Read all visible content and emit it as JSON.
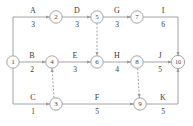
{
  "diagram": {
    "type": "activity-on-arrow-network",
    "title": "",
    "node_radius": 6.2,
    "accent_color": "#9a9a9a",
    "text_color": "#3b3b3b",
    "background": "#ffffff",
    "nodes": [
      {
        "id": "1",
        "label": "1",
        "x": 13,
        "y": 62
      },
      {
        "id": "2",
        "label": "2",
        "x": 56,
        "y": 17
      },
      {
        "id": "3",
        "label": "3",
        "x": 56,
        "y": 104
      },
      {
        "id": "4",
        "label": "4",
        "x": 52,
        "y": 62
      },
      {
        "id": "5",
        "label": "5",
        "x": 97,
        "y": 17
      },
      {
        "id": "6",
        "label": "6",
        "x": 97,
        "y": 62
      },
      {
        "id": "7",
        "label": "7",
        "x": 137,
        "y": 17
      },
      {
        "id": "8",
        "label": "8",
        "x": 137,
        "y": 62
      },
      {
        "id": "9",
        "label": "9",
        "x": 140,
        "y": 104
      },
      {
        "id": "10",
        "label": "10",
        "x": 178,
        "y": 62
      }
    ],
    "activities": [
      {
        "id": "A",
        "name": "A",
        "duration": "3",
        "from": "1",
        "to": "2",
        "label_x": 33,
        "label_y": 13,
        "dur_x": 33,
        "dur_y": 27
      },
      {
        "id": "B",
        "name": "B",
        "duration": "2",
        "from": "1",
        "to": "4",
        "label_x": 32,
        "label_y": 58,
        "dur_x": 32,
        "dur_y": 72
      },
      {
        "id": "C",
        "name": "C",
        "duration": "1",
        "from": "1",
        "to": "3",
        "label_x": 33,
        "label_y": 100,
        "dur_x": 33,
        "dur_y": 114
      },
      {
        "id": "D",
        "name": "D",
        "duration": "3",
        "from": "2",
        "to": "5",
        "label_x": 77,
        "label_y": 13,
        "dur_x": 77,
        "dur_y": 27
      },
      {
        "id": "E",
        "name": "E",
        "duration": "3",
        "from": "4",
        "to": "6",
        "label_x": 75,
        "label_y": 58,
        "dur_x": 75,
        "dur_y": 72
      },
      {
        "id": "F",
        "name": "F",
        "duration": "5",
        "from": "3",
        "to": "9",
        "label_x": 97,
        "label_y": 100,
        "dur_x": 97,
        "dur_y": 114
      },
      {
        "id": "G",
        "name": "G",
        "duration": "3",
        "from": "5",
        "to": "7",
        "label_x": 117,
        "label_y": 13,
        "dur_x": 117,
        "dur_y": 27
      },
      {
        "id": "H",
        "name": "H",
        "duration": "4",
        "from": "6",
        "to": "8",
        "label_x": 117,
        "label_y": 58,
        "dur_x": 117,
        "dur_y": 72
      },
      {
        "id": "I",
        "name": "I",
        "duration": "6",
        "from": "7",
        "to": "10",
        "label_x": 163,
        "label_y": 13,
        "dur_x": 163,
        "dur_y": 27
      },
      {
        "id": "J",
        "name": "J",
        "duration": "5",
        "from": "8",
        "to": "10",
        "label_x": 160,
        "label_y": 58,
        "dur_x": 160,
        "dur_y": 72
      },
      {
        "id": "K",
        "name": "K",
        "duration": "5",
        "from": "9",
        "to": "10",
        "label_x": 163,
        "label_y": 100,
        "dur_x": 163,
        "dur_y": 114
      }
    ],
    "dummy_activities": [
      {
        "id": "dummy-5-6",
        "from": "5",
        "to": "6"
      },
      {
        "id": "dummy-3-4",
        "from": "3",
        "to": "4"
      },
      {
        "id": "dummy-8-9",
        "from": "8",
        "to": "9"
      }
    ]
  }
}
